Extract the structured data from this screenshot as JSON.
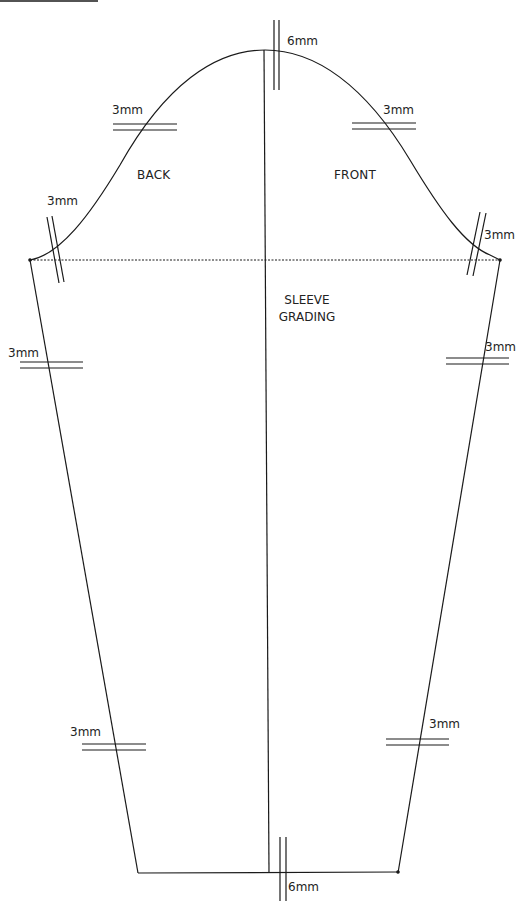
{
  "diagram": {
    "title_line1": "SLEEVE",
    "title_line2": "GRADING",
    "regions": {
      "back": "BACK",
      "front": "FRONT"
    },
    "grade_labels": {
      "crown_top": "6mm",
      "cap_back": "3mm",
      "cap_front": "3mm",
      "armhole_back": "3mm",
      "armhole_front": "3mm",
      "underarm_back": "3mm",
      "underarm_front": "3mm",
      "wrist_back": "3mm",
      "wrist_front": "3mm",
      "hem_bottom": "6mm"
    },
    "colors": {
      "line": "#1a1a1a",
      "background": "#ffffff"
    }
  }
}
